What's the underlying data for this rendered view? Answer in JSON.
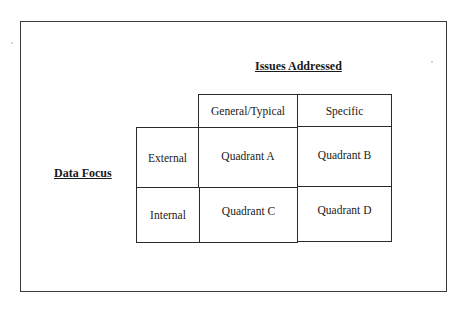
{
  "diagram": {
    "type": "2x2 matrix",
    "column_axis_title": "Issues Addressed",
    "row_axis_title": "Data Focus",
    "columns": [
      "General/Typical",
      "Specific"
    ],
    "rows": [
      {
        "label": "External",
        "cells": [
          "Quadrant A",
          "Quadrant B"
        ]
      },
      {
        "label": "Internal",
        "cells": [
          "Quadrant C",
          "Quadrant D"
        ]
      }
    ]
  },
  "colors": {
    "background": "#ffffff",
    "lines": "#2a2a2a",
    "text": "#1a1a1a"
  }
}
